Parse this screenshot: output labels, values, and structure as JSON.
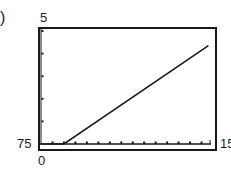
{
  "panel_label": ")",
  "window": {
    "ymax_label": "5",
    "ymin_label": "75",
    "xmin_label": "0",
    "xmax_label": "15"
  },
  "colors": {
    "ink": "#1a1a1a",
    "background": "#ffffff"
  },
  "chart_data": {
    "type": "line",
    "title": "",
    "xlabel": "",
    "ylabel": "",
    "xlim": [
      0,
      15
    ],
    "x_tick_step": 1,
    "y_tick_count": 5,
    "window_labels": {
      "top": "5",
      "left": "75",
      "bottom": "0",
      "right": "15"
    },
    "series": [
      {
        "name": "graph",
        "x": [
          0,
          2,
          14.6
        ],
        "y_fraction_of_window": [
          0.0,
          0.0,
          0.87
        ]
      }
    ],
    "grid": false,
    "legend": null
  }
}
